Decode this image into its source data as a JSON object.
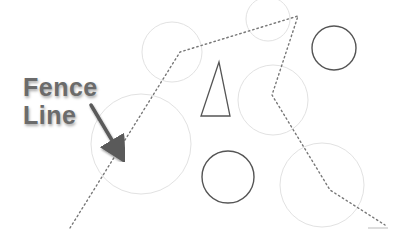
{
  "diagram": {
    "label": {
      "line1": "Fence",
      "line2": "Line"
    },
    "colors": {
      "background": "#ffffff",
      "faint_circle": "#e2e2e2",
      "dark_shape": "#555555",
      "fence_line": "#777777",
      "arrow": "#5a5a5a",
      "label_text": "#6b6b6b"
    },
    "fence_line_points": [
      [
        70,
        228
      ],
      [
        180,
        52
      ],
      [
        298,
        16
      ],
      [
        272,
        95
      ],
      [
        330,
        190
      ],
      [
        385,
        225
      ]
    ],
    "faint_circles": [
      {
        "cx": 172,
        "cy": 52,
        "r": 30
      },
      {
        "cx": 268,
        "cy": 19,
        "r": 22
      },
      {
        "cx": 273,
        "cy": 100,
        "r": 35
      },
      {
        "cx": 141,
        "cy": 144,
        "r": 50
      },
      {
        "cx": 322,
        "cy": 185,
        "r": 42
      }
    ],
    "dark_circles": [
      {
        "cx": 334,
        "cy": 48,
        "r": 22
      },
      {
        "cx": 228,
        "cy": 177,
        "r": 26
      }
    ],
    "triangle": {
      "points": [
        [
          219,
          62
        ],
        [
          201,
          116
        ],
        [
          230,
          116
        ]
      ]
    },
    "arrow": {
      "from": [
        91,
        105
      ],
      "to": [
        119,
        152
      ]
    }
  }
}
